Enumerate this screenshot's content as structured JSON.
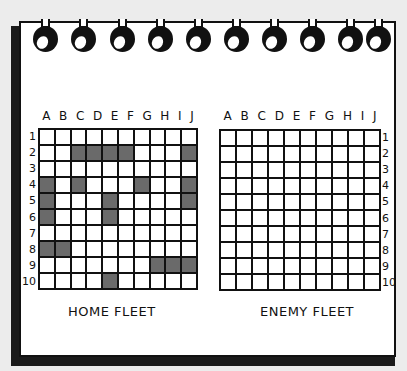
{
  "colors": {
    "background": "#ececec",
    "page": "#ffffff",
    "ink": "#111111",
    "ship": "#6a6a6a"
  },
  "binding": {
    "ring_count": 10,
    "ring_centers_x": [
      45,
      83,
      122,
      160,
      198,
      236,
      274,
      312,
      350,
      378
    ]
  },
  "columns": [
    "A",
    "B",
    "C",
    "D",
    "E",
    "F",
    "G",
    "H",
    "I",
    "J"
  ],
  "rows": [
    "1",
    "2",
    "3",
    "4",
    "5",
    "6",
    "7",
    "8",
    "9",
    "10"
  ],
  "home_fleet": {
    "caption": "HOME FLEET",
    "column_labels": [
      "A",
      "B",
      "C",
      "D",
      "E",
      "F",
      "G",
      "H",
      "I",
      "J"
    ],
    "row_labels": [
      "1",
      "2",
      "3",
      "4",
      "5",
      "6",
      "7",
      "8",
      "9",
      "10"
    ],
    "ship_cells": [
      "C2",
      "D2",
      "E2",
      "F2",
      "J2",
      "A4",
      "C4",
      "G4",
      "J4",
      "A5",
      "E5",
      "J5",
      "A6",
      "E6",
      "A8",
      "B8",
      "H9",
      "I9",
      "J9",
      "E10"
    ]
  },
  "enemy_fleet": {
    "caption": "ENEMY FLEET",
    "column_labels": [
      "A",
      "B",
      "C",
      "D",
      "E",
      "F",
      "G",
      "H",
      "I",
      "J"
    ],
    "row_labels": [
      "1",
      "2",
      "3",
      "4",
      "5",
      "6",
      "7",
      "8",
      "9",
      "10"
    ],
    "marked_cells": []
  }
}
